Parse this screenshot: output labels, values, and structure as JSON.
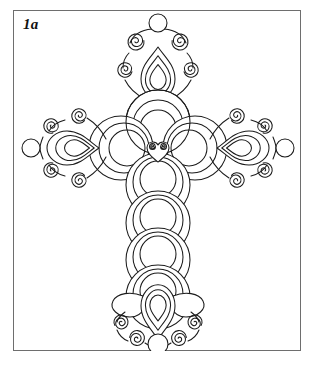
{
  "figure": {
    "label": "1a",
    "caption": "",
    "technique": "ink line drawing",
    "background_color": "#ffffff",
    "ink_color": "#1b1b1b",
    "frame_color": "#6e6e6e"
  },
  "frame": {
    "x": 13,
    "y": 10,
    "width": 288,
    "height": 341,
    "border_width": 1
  },
  "cross": {
    "center_x": 158,
    "center_y": 148,
    "total_height": 330,
    "total_width": 250,
    "motifs": [
      "concentric-circles",
      "teardrop",
      "spiral-scroll",
      "small-disc",
      "heart-boss"
    ],
    "arms": [
      {
        "name": "top-arm",
        "terminal": "teardrop-with-four-spirals-and-disc",
        "shaft_nodes": 1
      },
      {
        "name": "left-arm",
        "terminal": "horizontal-teardrop-with-four-spirals-and-disc",
        "shaft_nodes": 1
      },
      {
        "name": "right-arm",
        "terminal": "horizontal-teardrop-with-four-spirals-and-disc",
        "shaft_nodes": 1
      },
      {
        "name": "bottom-arm",
        "terminal": "teardrop-with-wings-four-spirals-and-disc",
        "shaft_nodes": 3
      }
    ],
    "center_boss": {
      "name": "heart-boss",
      "spirals": 2
    }
  }
}
